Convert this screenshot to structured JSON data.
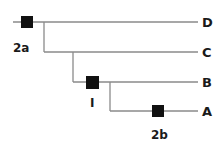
{
  "diagram": {
    "type": "cladogram",
    "taxa": [
      {
        "label": "D",
        "y": 22
      },
      {
        "label": "C",
        "y": 52
      },
      {
        "label": "B",
        "y": 82
      },
      {
        "label": "A",
        "y": 111
      }
    ],
    "markers": [
      {
        "id": "2a",
        "label": "2a",
        "branch": "root"
      },
      {
        "id": "I",
        "label": "I",
        "branch": "A+B ancestor"
      },
      {
        "id": "2b",
        "label": "2b",
        "branch": "A"
      }
    ],
    "colors": {
      "line": "#8a8a8a",
      "marker": "#111111",
      "text": "#1a1a1a"
    }
  }
}
